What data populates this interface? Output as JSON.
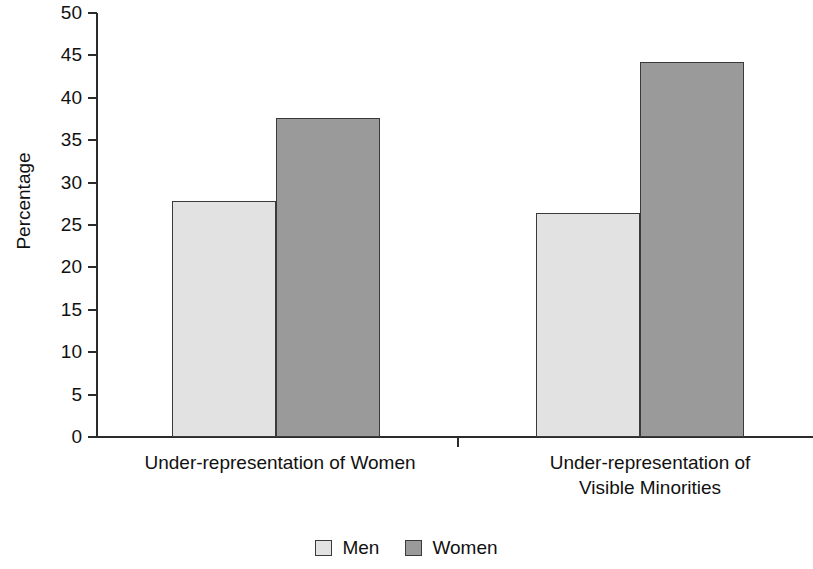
{
  "chart_data": {
    "type": "bar",
    "title": "",
    "subtitle": "",
    "xlabel": "",
    "ylabel": "Percentage",
    "ylim": [
      0,
      50
    ],
    "ytick_step": 5,
    "yticks": [
      50,
      45,
      40,
      35,
      30,
      25,
      20,
      15,
      10,
      5,
      0
    ],
    "ytick_labels": [
      "50",
      "45",
      "40",
      "35",
      "30",
      "25",
      "20",
      "15",
      "10",
      "5",
      "0"
    ],
    "grid": false,
    "legend_position": "bottom-center",
    "categories": [
      "Under-representation of Women",
      "Under-representation of\nVisible Minorities"
    ],
    "series": [
      {
        "name": "Men",
        "color": "#e2e2e2",
        "values": [
          27.8,
          26.4
        ]
      },
      {
        "name": "Women",
        "color": "#9a9a9a",
        "values": [
          37.6,
          44.2
        ]
      }
    ],
    "annotations": []
  },
  "legend": {
    "items": [
      {
        "label": "Men"
      },
      {
        "label": "Women"
      }
    ]
  },
  "colors": {
    "men_fill": "#e2e2e2",
    "women_fill": "#9a9a9a",
    "bar_stroke": "#3a3a3a",
    "axis": "#2b2b2b",
    "text": "#111111",
    "background": "#ffffff"
  }
}
